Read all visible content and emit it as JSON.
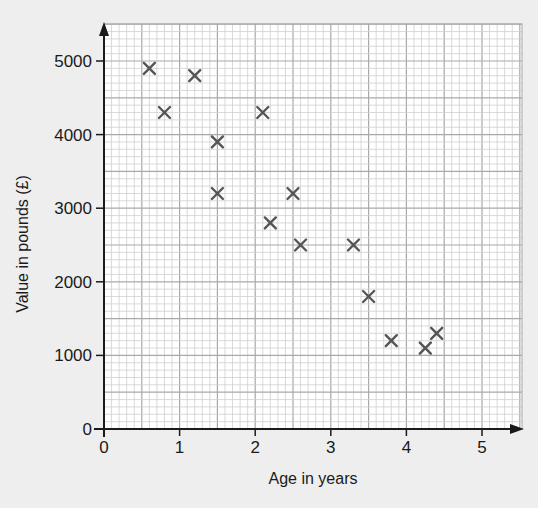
{
  "chart_data": {
    "type": "scatter",
    "title": "",
    "xlabel": "Age in years",
    "ylabel": "Value in pounds (£)",
    "xlim": [
      0,
      5.5
    ],
    "ylim": [
      0,
      5400
    ],
    "xticks": [
      0,
      1,
      2,
      3,
      4,
      5
    ],
    "yticks": [
      0,
      1000,
      2000,
      3000,
      4000,
      5000
    ],
    "xtick_labels": [
      "0",
      "1",
      "2",
      "3",
      "4",
      "5"
    ],
    "ytick_labels": [
      "0",
      "1000",
      "2000",
      "3000",
      "4000",
      "5000"
    ],
    "grid": true,
    "grid_minor_x": 0.1,
    "grid_minor_y": 100,
    "marker": "x",
    "marker_color": "#555555",
    "points": [
      {
        "x": 0.6,
        "y": 4900
      },
      {
        "x": 0.8,
        "y": 4300
      },
      {
        "x": 1.2,
        "y": 4800
      },
      {
        "x": 1.5,
        "y": 3900
      },
      {
        "x": 1.5,
        "y": 3200
      },
      {
        "x": 2.1,
        "y": 4300
      },
      {
        "x": 2.2,
        "y": 2800
      },
      {
        "x": 2.5,
        "y": 3200
      },
      {
        "x": 2.6,
        "y": 2500
      },
      {
        "x": 3.3,
        "y": 2500
      },
      {
        "x": 3.5,
        "y": 1800
      },
      {
        "x": 3.8,
        "y": 1200
      },
      {
        "x": 4.25,
        "y": 1100
      },
      {
        "x": 4.4,
        "y": 1300
      }
    ],
    "legend": null
  }
}
